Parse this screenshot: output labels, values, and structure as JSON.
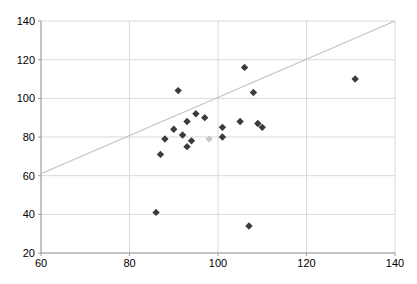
{
  "chart_data": {
    "type": "scatter",
    "title": "",
    "xlabel": "",
    "ylabel": "",
    "xlim": [
      60,
      140
    ],
    "ylim": [
      20,
      140
    ],
    "x_ticks": [
      "60",
      "80",
      "100",
      "120",
      "140"
    ],
    "y_ticks": [
      "20",
      "40",
      "60",
      "80",
      "100",
      "120",
      "140"
    ],
    "x_tick_values": [
      60,
      80,
      100,
      120,
      140
    ],
    "y_tick_values": [
      20,
      40,
      60,
      80,
      100,
      120,
      140
    ],
    "grid": true,
    "legend": "none",
    "colors": {
      "grid": "#d9d9d9",
      "axis": "#9b9b9b",
      "tick_label": "#000000",
      "marker_dark": "#3b3b3b",
      "marker_light": "#c9c9c9",
      "trend_line": "#c3c3c3",
      "background": "#ffffff"
    },
    "series": [
      {
        "name": "dark-diamond-series",
        "marker": "diamond",
        "color": "#3b3b3b",
        "points": [
          [
            86,
            41
          ],
          [
            87,
            71
          ],
          [
            88,
            79
          ],
          [
            90,
            84
          ],
          [
            91,
            104
          ],
          [
            92,
            81
          ],
          [
            93,
            75
          ],
          [
            93,
            88
          ],
          [
            94,
            78
          ],
          [
            95,
            92
          ],
          [
            97,
            90
          ],
          [
            101,
            85
          ],
          [
            101,
            80
          ],
          [
            105,
            88
          ],
          [
            106,
            116
          ],
          [
            107,
            34
          ],
          [
            108,
            103
          ],
          [
            109,
            87
          ],
          [
            110,
            85
          ],
          [
            131,
            110
          ]
        ]
      },
      {
        "name": "light-diamond-series",
        "marker": "diamond",
        "color": "#c9c9c9",
        "points": [
          [
            98,
            79
          ]
        ]
      }
    ],
    "trend_line": {
      "from": [
        60,
        61
      ],
      "to": [
        140,
        140
      ],
      "color": "#c3c3c3"
    }
  }
}
